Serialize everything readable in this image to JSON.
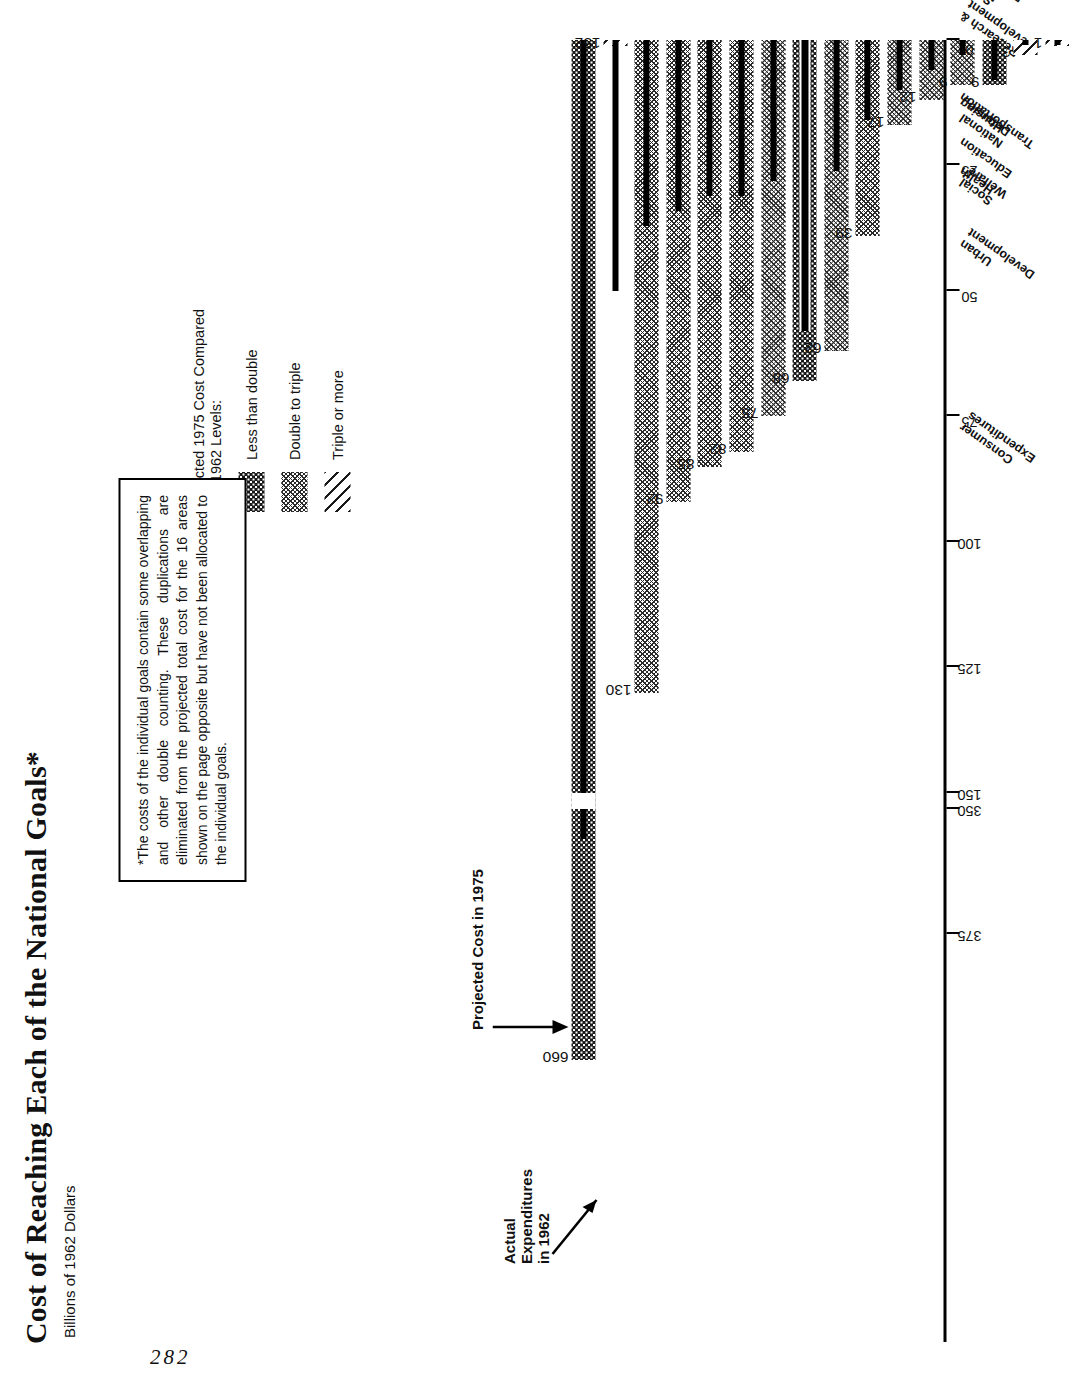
{
  "page_number": "282",
  "header": {
    "title": "Cost of Reaching Each of the National Goals*",
    "subtitle": "Billions of 1962 Dollars"
  },
  "legend": {
    "title": "Projected 1975 Cost Compared\nwith 1962 Levels:",
    "title_line1": "Projected 1975 Cost Compared",
    "title_line2": "with 1962 Levels:",
    "items": [
      {
        "label": "Less than double",
        "pattern": "dots"
      },
      {
        "label": "Double to triple",
        "pattern": "crosshatch"
      },
      {
        "label": "Triple or more",
        "pattern": "diagonal"
      }
    ]
  },
  "footnote": {
    "text": "*The costs of the individual goals contain some overlapping and other double counting. These duplications are eliminated from the projected total cost for the 16 areas shown on the page opposite but have not been allocated to the individual goals."
  },
  "annotations": [
    {
      "name": "actual-1962",
      "line1": "Actual",
      "line2": "Expenditures",
      "line3": "in 1962"
    },
    {
      "name": "projected-1975",
      "text": "Projected Cost in 1975"
    }
  ],
  "chart_data": {
    "type": "bar",
    "title": "Cost of Reaching Each of the National Goals*",
    "subtitle": "Billions of 1962 Dollars",
    "xlabel": "",
    "ylabel": "Billions of 1962 Dollars",
    "orientation": "vertical",
    "axis_break": {
      "between": [
        150,
        350
      ],
      "note": "scale break between 150 and 350"
    },
    "ticks": [
      "375",
      "350",
      "150",
      "125",
      "100",
      "75",
      "50",
      "25",
      "0"
    ],
    "tick_values": [
      375,
      350,
      150,
      125,
      100,
      75,
      50,
      25,
      0
    ],
    "categories": [
      "Consumer Expenditures",
      "Private Plant & Equipment",
      "Urban Development",
      "Social Welfare",
      "Health",
      "Education",
      "Transportation",
      "National Defense",
      "Housing",
      "Research & Development",
      "Natural Resources",
      "International Aid",
      "Space",
      "Agriculture",
      "Manpower Retraining",
      "Area Redevelopment"
    ],
    "series": [
      {
        "name": "Projected Cost in 1975",
        "values": [
          660,
          152,
          130,
          92,
          85,
          82,
          75,
          68,
          62,
          39,
          17,
          12,
          9,
          9,
          3,
          1
        ]
      },
      {
        "name": "Actual Expenditures in 1962",
        "values": [
          356,
          50,
          37,
          34,
          31,
          31,
          28,
          58,
          26,
          16,
          10,
          6,
          3,
          8,
          1,
          0.3
        ]
      }
    ],
    "value_labels": [
      "660",
      "152",
      "130",
      "92",
      "85",
      "82",
      "75",
      "68",
      "62",
      "39",
      "17",
      "12",
      "9",
      "9",
      "3",
      "1"
    ],
    "patterns": [
      "dots",
      "diagonal",
      "crosshatch",
      "crosshatch",
      "crosshatch",
      "crosshatch",
      "crosshatch",
      "dots",
      "crosshatch",
      "crosshatch",
      "crosshatch",
      "crosshatch",
      "crosshatch",
      "dots",
      "diagonal",
      "diagonal"
    ],
    "legend_position": "upper-right",
    "grid": false
  }
}
